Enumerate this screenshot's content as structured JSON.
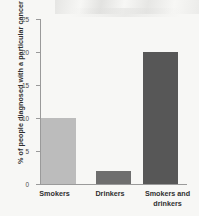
{
  "chart_data": {
    "type": "bar",
    "title": "",
    "subtitle": "",
    "xlabel": "",
    "ylabel": "% of people diagnosed with a particular cancer",
    "categories": [
      "Smokers",
      "Drinkers",
      "Smokers and drinkers"
    ],
    "values": [
      10,
      2,
      20
    ],
    "series": [
      {
        "name": "% of people diagnosed with a particular cancer",
        "values": [
          10,
          2,
          20
        ]
      }
    ],
    "bar_colors": [
      "#bcbcbc",
      "#6e6e6e",
      "#575757"
    ],
    "ylim": [
      0,
      25
    ],
    "yticks": [
      0,
      5,
      10,
      15,
      20,
      25
    ],
    "ytick_labels": [
      "0",
      "5",
      "10",
      "15",
      "20",
      "25"
    ],
    "xtick_labels": [
      "Smokers",
      "Drinkers",
      "Smokers and drinkers"
    ],
    "grid": false,
    "legend": false,
    "legend_position": "none",
    "background_color": "#f7f7f5",
    "axis_color": "#9a9a9a",
    "annotations": []
  },
  "axis": {
    "y_title": "% of people diagnosed with a particular cancer",
    "ticks": [
      {
        "label": "25",
        "value": 25
      },
      {
        "label": "20",
        "value": 20
      },
      {
        "label": "15",
        "value": 15
      },
      {
        "label": "10",
        "value": 10
      },
      {
        "label": "5",
        "value": 5
      },
      {
        "label": "0",
        "value": 0
      }
    ]
  },
  "bars": [
    {
      "label": "Smokers",
      "label_line1": "Smokers",
      "label_line2": "",
      "value": 10,
      "color": "#bcbcbc"
    },
    {
      "label": "Drinkers",
      "label_line1": "Drinkers",
      "label_line2": "",
      "value": 2,
      "color": "#6e6e6e"
    },
    {
      "label": "Smokers and drinkers",
      "label_line1": "Smokers and",
      "label_line2": "drinkers",
      "value": 20,
      "color": "#575757"
    }
  ]
}
